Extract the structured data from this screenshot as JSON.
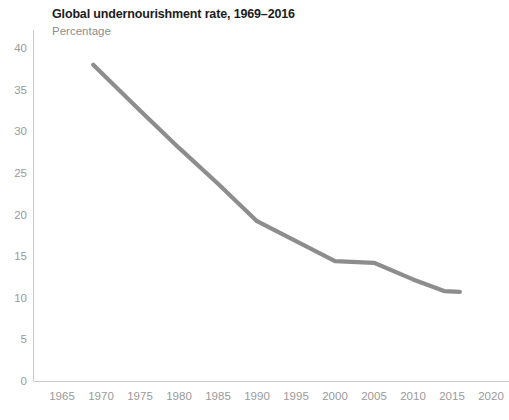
{
  "chart_data": {
    "type": "line",
    "title": "Global undernourishment rate, 1969–2016",
    "subtitle": "Percentage",
    "xlabel": "",
    "ylabel": "",
    "ylim": [
      0,
      42
    ],
    "xlim": [
      1963,
      2022
    ],
    "grid": false,
    "legend": "none",
    "line_color": "#8d8d8d",
    "x_ticks": [
      "1965",
      "1970",
      "1975",
      "1980",
      "1985",
      "1990",
      "1995",
      "2000",
      "2005",
      "2010",
      "2015",
      "2020"
    ],
    "y_ticks": [
      "0",
      "5",
      "10",
      "15",
      "20",
      "25",
      "30",
      "35",
      "40"
    ],
    "series": [
      {
        "name": "Global undernourishment rate",
        "x": [
          1969,
          1975,
          1980,
          1985,
          1990,
          1995,
          2000,
          2005,
          2010,
          2014,
          2016
        ],
        "values": [
          38.0,
          32.5,
          28.0,
          23.7,
          19.2,
          16.8,
          14.4,
          14.2,
          12.2,
          10.8,
          10.7
        ]
      }
    ]
  }
}
